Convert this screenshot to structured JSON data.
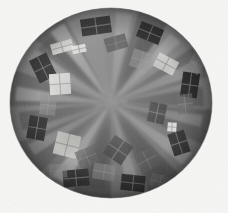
{
  "image": {
    "title": "polar-warped grayscale abstract",
    "width": 228,
    "height": 213,
    "background_color": "#f6f6f5",
    "description": "Circular fisheye / polar-coordinate warped grayscale photograph showing radial wedges of alternating gray tones with scattered bright and dark rectangular patches arranged around the rim."
  },
  "disc": {
    "center_x": 111,
    "center_y": 103,
    "radius_x": 101,
    "radius_y": 95,
    "rim_color": "#6e6e6e",
    "rim_shadow_color": "#4f4f4f",
    "base_color": "#787878"
  },
  "palette": {
    "background": "#f6f6f5",
    "darkest": "#1d1d1d",
    "dark": "#3a3a3a",
    "mid_dark": "#555555",
    "mid": "#707070",
    "mid_light": "#8c8c8c",
    "light": "#a8a8a8",
    "lighter": "#c6c6c6",
    "brightest": "#f0f0ee"
  },
  "wedges": [
    {
      "id": "wedge-01",
      "start_deg": -96,
      "end_deg": -74,
      "fill": "#8a8a8a"
    },
    {
      "id": "wedge-02",
      "start_deg": -74,
      "end_deg": -56,
      "fill": "#6a6a6a"
    },
    {
      "id": "wedge-03",
      "start_deg": -56,
      "end_deg": -36,
      "fill": "#8f8f8f"
    },
    {
      "id": "wedge-04",
      "start_deg": -36,
      "end_deg": -16,
      "fill": "#6f6f6f"
    },
    {
      "id": "wedge-05",
      "start_deg": -16,
      "end_deg": 4,
      "fill": "#848484"
    },
    {
      "id": "wedge-06",
      "start_deg": 4,
      "end_deg": 26,
      "fill": "#636363"
    },
    {
      "id": "wedge-07",
      "start_deg": 26,
      "end_deg": 48,
      "fill": "#7d7d7d"
    },
    {
      "id": "wedge-08",
      "start_deg": 48,
      "end_deg": 68,
      "fill": "#5c5c5c"
    },
    {
      "id": "wedge-09",
      "start_deg": 68,
      "end_deg": 90,
      "fill": "#757575"
    },
    {
      "id": "wedge-10",
      "start_deg": 90,
      "end_deg": 112,
      "fill": "#5a5a5a"
    },
    {
      "id": "wedge-11",
      "start_deg": 112,
      "end_deg": 134,
      "fill": "#787878"
    },
    {
      "id": "wedge-12",
      "start_deg": 134,
      "end_deg": 156,
      "fill": "#676767"
    },
    {
      "id": "wedge-13",
      "start_deg": 156,
      "end_deg": 178,
      "fill": "#828282"
    },
    {
      "id": "wedge-14",
      "start_deg": 178,
      "end_deg": 200,
      "fill": "#696969"
    },
    {
      "id": "wedge-15",
      "start_deg": 200,
      "end_deg": 222,
      "fill": "#8b8b8b"
    },
    {
      "id": "wedge-16",
      "start_deg": 222,
      "end_deg": 243,
      "fill": "#717171"
    },
    {
      "id": "wedge-17",
      "start_deg": 243,
      "end_deg": 264,
      "fill": "#909090"
    }
  ],
  "spokes": [
    {
      "id": "spoke-bright-01",
      "angle_deg": -82,
      "half_width_deg": 5.0,
      "inner": 14,
      "outer": 96,
      "fill": "#a8a8a8",
      "opacity": 0.75
    },
    {
      "id": "spoke-bright-02",
      "angle_deg": -47,
      "half_width_deg": 4.2,
      "inner": 12,
      "outer": 94,
      "fill": "#b2b2b2",
      "opacity": 0.7
    },
    {
      "id": "spoke-bright-03",
      "angle_deg": -24,
      "half_width_deg": 4.6,
      "inner": 10,
      "outer": 95,
      "fill": "#a2a2a2",
      "opacity": 0.68
    },
    {
      "id": "spoke-bright-04",
      "angle_deg": 12,
      "half_width_deg": 4.0,
      "inner": 12,
      "outer": 92,
      "fill": "#9c9c9c",
      "opacity": 0.62
    },
    {
      "id": "spoke-bright-05",
      "angle_deg": 38,
      "half_width_deg": 4.8,
      "inner": 10,
      "outer": 96,
      "fill": "#ababab",
      "opacity": 0.7
    },
    {
      "id": "spoke-bright-06",
      "angle_deg": 76,
      "half_width_deg": 4.4,
      "inner": 12,
      "outer": 94,
      "fill": "#9f9f9f",
      "opacity": 0.66
    },
    {
      "id": "spoke-bright-07",
      "angle_deg": 122,
      "half_width_deg": 5.2,
      "inner": 10,
      "outer": 96,
      "fill": "#b6b6b6",
      "opacity": 0.72
    },
    {
      "id": "spoke-bright-08",
      "angle_deg": 148,
      "half_width_deg": 4.0,
      "inner": 12,
      "outer": 93,
      "fill": "#a0a0a0",
      "opacity": 0.62
    },
    {
      "id": "spoke-bright-09",
      "angle_deg": 186,
      "half_width_deg": 4.6,
      "inner": 10,
      "outer": 95,
      "fill": "#aeaeae",
      "opacity": 0.7
    },
    {
      "id": "spoke-bright-10",
      "angle_deg": 212,
      "half_width_deg": 4.2,
      "inner": 12,
      "outer": 94,
      "fill": "#a4a4a4",
      "opacity": 0.66
    },
    {
      "id": "spoke-bright-11",
      "angle_deg": 236,
      "half_width_deg": 5.0,
      "inner": 10,
      "outer": 96,
      "fill": "#bcbcbc",
      "opacity": 0.74
    },
    {
      "id": "spoke-dark-01",
      "angle_deg": -62,
      "half_width_deg": 6.0,
      "inner": 16,
      "outer": 92,
      "fill": "#4e4e4e",
      "opacity": 0.55
    },
    {
      "id": "spoke-dark-02",
      "angle_deg": -4,
      "half_width_deg": 6.5,
      "inner": 16,
      "outer": 92,
      "fill": "#474747",
      "opacity": 0.52
    },
    {
      "id": "spoke-dark-03",
      "angle_deg": 58,
      "half_width_deg": 6.0,
      "inner": 16,
      "outer": 92,
      "fill": "#4c4c4c",
      "opacity": 0.55
    },
    {
      "id": "spoke-dark-04",
      "angle_deg": 100,
      "half_width_deg": 6.5,
      "inner": 16,
      "outer": 92,
      "fill": "#454545",
      "opacity": 0.5
    },
    {
      "id": "spoke-dark-05",
      "angle_deg": 168,
      "half_width_deg": 6.0,
      "inner": 16,
      "outer": 92,
      "fill": "#4a4a4a",
      "opacity": 0.52
    },
    {
      "id": "spoke-dark-06",
      "angle_deg": 224,
      "half_width_deg": 6.0,
      "inner": 16,
      "outer": 92,
      "fill": "#4f4f4f",
      "opacity": 0.5
    }
  ],
  "patches": [
    {
      "id": "patch-01",
      "cx": 96,
      "cy": 26,
      "w": 30,
      "h": 17,
      "rot": -8,
      "fill": "#2a2a2a",
      "opacity": 0.93,
      "kind": "dark"
    },
    {
      "id": "patch-02",
      "cx": 150,
      "cy": 33,
      "w": 24,
      "h": 16,
      "rot": 22,
      "fill": "#242424",
      "opacity": 0.92,
      "kind": "dark"
    },
    {
      "id": "patch-03",
      "cx": 190,
      "cy": 85,
      "w": 17,
      "h": 25,
      "rot": 8,
      "fill": "#1f1f1f",
      "opacity": 0.94,
      "kind": "dark"
    },
    {
      "id": "patch-04",
      "cx": 179,
      "cy": 143,
      "w": 17,
      "h": 23,
      "rot": -18,
      "fill": "#2c2c2c",
      "opacity": 0.92,
      "kind": "dark"
    },
    {
      "id": "patch-05",
      "cx": 133,
      "cy": 183,
      "w": 24,
      "h": 16,
      "rot": 6,
      "fill": "#232323",
      "opacity": 0.93,
      "kind": "dark"
    },
    {
      "id": "patch-06",
      "cx": 76,
      "cy": 178,
      "w": 26,
      "h": 17,
      "rot": -5,
      "fill": "#292929",
      "opacity": 0.92,
      "kind": "dark"
    },
    {
      "id": "patch-07",
      "cx": 37,
      "cy": 128,
      "w": 18,
      "h": 23,
      "rot": 10,
      "fill": "#2b2b2b",
      "opacity": 0.92,
      "kind": "dark"
    },
    {
      "id": "patch-08",
      "cx": 43,
      "cy": 68,
      "w": 19,
      "h": 25,
      "rot": -26,
      "fill": "#272727",
      "opacity": 0.93,
      "kind": "dark"
    },
    {
      "id": "patch-09",
      "cx": 118,
      "cy": 150,
      "w": 22,
      "h": 22,
      "rot": 34,
      "fill": "#383838",
      "opacity": 0.8,
      "kind": "dark"
    },
    {
      "id": "patch-10",
      "cx": 157,
      "cy": 113,
      "w": 17,
      "h": 20,
      "rot": 12,
      "fill": "#333333",
      "opacity": 0.8,
      "kind": "dark"
    },
    {
      "id": "patch-11",
      "cx": 60,
      "cy": 84,
      "w": 21,
      "h": 21,
      "rot": -4,
      "fill": "#ededea",
      "opacity": 0.95,
      "kind": "bright"
    },
    {
      "id": "patch-12",
      "cx": 62,
      "cy": 47,
      "w": 22,
      "h": 11,
      "rot": -16,
      "fill": "#e0e0dd",
      "opacity": 0.88,
      "kind": "bright"
    },
    {
      "id": "patch-13",
      "cx": 67,
      "cy": 145,
      "w": 24,
      "h": 23,
      "rot": 14,
      "fill": "#cfcfcb",
      "opacity": 0.88,
      "kind": "bright"
    },
    {
      "id": "patch-14",
      "cx": 166,
      "cy": 64,
      "w": 22,
      "h": 15,
      "rot": 28,
      "fill": "#d8d8d5",
      "opacity": 0.88,
      "kind": "bright"
    },
    {
      "id": "patch-15",
      "cx": 172,
      "cy": 127,
      "w": 9,
      "h": 9,
      "rot": 4,
      "fill": "#f2f2ef",
      "opacity": 0.97,
      "kind": "bright"
    },
    {
      "id": "patch-16",
      "cx": 79,
      "cy": 49,
      "w": 14,
      "h": 8,
      "rot": -12,
      "fill": "#f0f0ec",
      "opacity": 0.9,
      "kind": "bright"
    },
    {
      "id": "patch-17",
      "cx": 116,
      "cy": 43,
      "w": 22,
      "h": 14,
      "rot": -16,
      "fill": "#4b4b4b",
      "opacity": 0.7,
      "kind": "mid"
    },
    {
      "id": "patch-18",
      "cx": 141,
      "cy": 60,
      "w": 20,
      "h": 18,
      "rot": 18,
      "fill": "#9d9d9d",
      "opacity": 0.6,
      "kind": "mid"
    },
    {
      "id": "patch-19",
      "cx": 87,
      "cy": 157,
      "w": 20,
      "h": 18,
      "rot": -22,
      "fill": "#5e5e5e",
      "opacity": 0.62,
      "kind": "mid"
    },
    {
      "id": "patch-20",
      "cx": 48,
      "cy": 105,
      "w": 16,
      "h": 20,
      "rot": 6,
      "fill": "#949494",
      "opacity": 0.55,
      "kind": "mid"
    },
    {
      "id": "patch-21",
      "cx": 185,
      "cy": 104,
      "w": 16,
      "h": 20,
      "rot": -6,
      "fill": "#6b6b6b",
      "opacity": 0.6,
      "kind": "mid"
    },
    {
      "id": "patch-22",
      "cx": 104,
      "cy": 172,
      "w": 22,
      "h": 16,
      "rot": 9,
      "fill": "#8c8c8c",
      "opacity": 0.55,
      "kind": "mid"
    },
    {
      "id": "patch-23",
      "cx": 147,
      "cy": 160,
      "w": 20,
      "h": 20,
      "rot": -28,
      "fill": "#5a5a5a",
      "opacity": 0.6,
      "kind": "mid"
    },
    {
      "id": "patch-24",
      "cx": 58,
      "cy": 171,
      "w": 18,
      "h": 14,
      "rot": -3,
      "fill": "#9a9a9a",
      "opacity": 0.5,
      "kind": "mid"
    },
    {
      "id": "patch-25",
      "cx": 160,
      "cy": 182,
      "w": 20,
      "h": 14,
      "rot": 16,
      "fill": "#6e6e6e",
      "opacity": 0.55,
      "kind": "mid"
    },
    {
      "id": "patch-26",
      "cx": 196,
      "cy": 64,
      "w": 14,
      "h": 18,
      "rot": 30,
      "fill": "#8f8f8f",
      "opacity": 0.5,
      "kind": "mid"
    }
  ]
}
